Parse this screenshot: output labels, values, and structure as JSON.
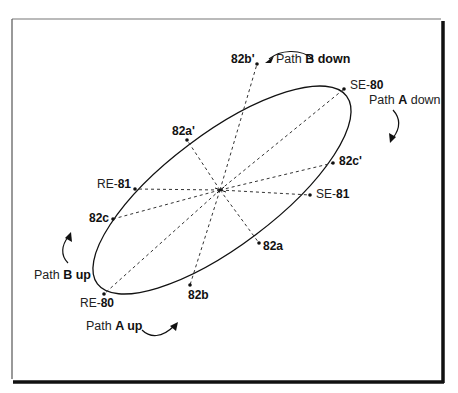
{
  "diagram": {
    "frame": {
      "color": "#111111",
      "shadow_color": "#111111"
    },
    "ellipse": {
      "cx": 222,
      "cy": 190,
      "rx": 155,
      "ry": 55,
      "rotation_deg": -37,
      "stroke": "#111111"
    },
    "center": {
      "x": 220,
      "y": 190
    },
    "points": [
      {
        "id": "SE-80",
        "prefix": "SE-",
        "num": "80",
        "x": 344,
        "y": 89,
        "lx": 350,
        "ly": 79
      },
      {
        "id": "82b'",
        "text": "82b'",
        "x": 257,
        "y": 64,
        "lx": 231,
        "ly": 53
      },
      {
        "id": "82a'",
        "text": "82a'",
        "x": 187,
        "y": 140,
        "lx": 172,
        "ly": 125
      },
      {
        "id": "RE-81",
        "prefix": "RE-",
        "num": "81",
        "x": 135,
        "y": 189,
        "lx": 97,
        "ly": 178
      },
      {
        "id": "82c",
        "text": "82c",
        "x": 113,
        "y": 219,
        "lx": 89,
        "ly": 212
      },
      {
        "id": "RE-80",
        "prefix": "RE-",
        "num": "80",
        "x": 104,
        "y": 294,
        "lx": 80,
        "ly": 297
      },
      {
        "id": "82b",
        "text": "82b",
        "x": 190,
        "y": 285,
        "lx": 188,
        "ly": 289
      },
      {
        "id": "82a",
        "text": "82a",
        "x": 259,
        "y": 243,
        "lx": 263,
        "ly": 240
      },
      {
        "id": "SE-81",
        "prefix": "SE-",
        "num": "81",
        "x": 310,
        "y": 195,
        "lx": 316,
        "ly": 188
      },
      {
        "id": "82c'",
        "text": "82c'",
        "x": 333,
        "y": 163,
        "lx": 339,
        "ly": 155
      }
    ],
    "labels": {
      "path_b_down": {
        "prefix": "Path ",
        "bold": "B down"
      },
      "path_a_down": {
        "prefix": "Path ",
        "bold": "A",
        "suffix": " down"
      },
      "path_b_up": {
        "prefix": "Path ",
        "bold": "B up"
      },
      "path_a_up": {
        "prefix": "Path ",
        "bold": "A up"
      }
    }
  }
}
